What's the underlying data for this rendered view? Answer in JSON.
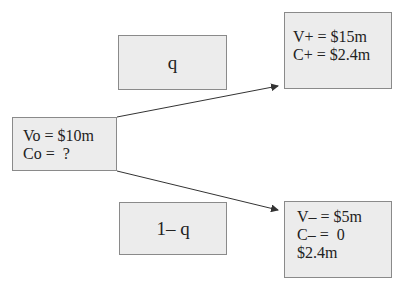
{
  "diagram": {
    "type": "binomial-tree",
    "root": {
      "lines": [
        "Vo = $10m",
        "Co =  ?"
      ]
    },
    "up_probability": {
      "label": "q"
    },
    "down_probability": {
      "label": "1– q"
    },
    "up_state": {
      "lines": [
        "V+ = $15m",
        "C+ = $2.4m"
      ]
    },
    "down_state": {
      "lines": [
        "V– = $5m",
        "C– =  0",
        "$2.4m"
      ]
    },
    "colors": {
      "box_fill": "#ececec",
      "box_border": "#8a8a8a",
      "arrow": "#333333",
      "text": "#222222"
    }
  }
}
